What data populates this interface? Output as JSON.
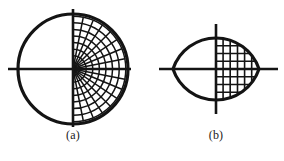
{
  "figure": {
    "background_color": "#ffffff",
    "ink_color": "#141414",
    "panels": [
      {
        "id": "panel-a",
        "caption": "(a)",
        "shape_type": "circle",
        "mesh_type": "polar",
        "description": "Circle with polar (radial) mesh filling the right half",
        "center": {
          "x": 73,
          "y": 69
        },
        "radius": 55,
        "outline_width": 3.2,
        "mesh_line_width": 1.5,
        "axis_line_width": 2.6,
        "axis_horizontal": {
          "x1": 8,
          "y1": 69,
          "x2": 131,
          "y2": 69
        },
        "axis_vertical": {
          "x1": 73,
          "y1": 9,
          "x2": 73,
          "y2": 127
        },
        "mesh": {
          "radial_line_count": 17,
          "arc_count": 8,
          "angle_start_deg": -90,
          "angle_end_deg": 90,
          "radii_fractions": [
            0.12,
            0.24,
            0.36,
            0.48,
            0.6,
            0.72,
            0.84,
            0.96
          ]
        }
      },
      {
        "id": "panel-b",
        "caption": "(b)",
        "shape_type": "lens",
        "mesh_type": "cartesian",
        "description": "Lens (vesica) formed by two circular arcs, with rectangular mesh filling the right half",
        "center": {
          "x": 216,
          "y": 69
        },
        "half_width": 43,
        "half_height": 31,
        "outline_width": 3.2,
        "mesh_line_width": 1.6,
        "axis_line_width": 2.6,
        "axis_horizontal": {
          "x1": 159,
          "y1": 69,
          "x2": 278,
          "y2": 69
        },
        "axis_vertical": {
          "x1": 216,
          "y1": 24,
          "x2": 216,
          "y2": 114
        },
        "mesh": {
          "vertical_line_count": 5,
          "horizontal_line_count": 7,
          "vertical_fractions": [
            0.165,
            0.33,
            0.5,
            0.665,
            0.83
          ],
          "horizontal_fractions": [
            -0.75,
            -0.5,
            -0.25,
            0.0,
            0.25,
            0.5,
            0.75
          ]
        }
      }
    ]
  }
}
